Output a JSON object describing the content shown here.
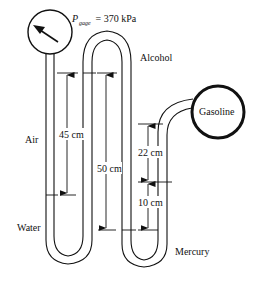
{
  "diagram": {
    "gauge": {
      "label_main": "P",
      "label_sub": "gage",
      "label_value": " = 370 kPa"
    },
    "fluids": {
      "air": "Air",
      "water": "Water",
      "alcohol": "Alcohol",
      "mercury": "Mercury",
      "gasoline": "Gasoline"
    },
    "dimensions": {
      "d1": "45 cm",
      "d2": "50 cm",
      "d3": "22 cm",
      "d4": "10 cm"
    },
    "colors": {
      "stroke": "#111111",
      "background": "#ffffff"
    }
  }
}
